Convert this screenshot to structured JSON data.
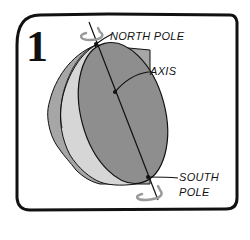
{
  "panel": {
    "number": "1",
    "labels": {
      "north_pole": "NORTH POLE",
      "axis": "AXIS",
      "south_pole_line1": "SOUTH",
      "south_pole_line2": "POLE"
    }
  },
  "colors": {
    "border": "#111111",
    "face": "#8e8e8e",
    "rim": "#d6d6d6",
    "outer_shadow": "#a6a6a6",
    "rotation_arrow": "#9a9a9a",
    "background": "#ffffff"
  }
}
